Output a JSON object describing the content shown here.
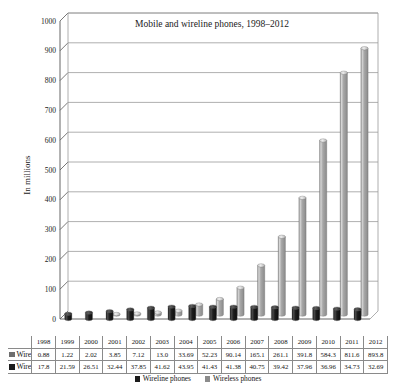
{
  "chart_data": {
    "type": "bar",
    "title": "Mobile and wireline phones, 1998–2012",
    "xlabel": "",
    "ylabel": "In millions",
    "ylim": [
      0,
      1000
    ],
    "ytick_step": 100,
    "yticks": [
      "0",
      "100",
      "200",
      "300",
      "400",
      "500",
      "600",
      "700",
      "800",
      "900",
      "1000"
    ],
    "grid": "horizontal",
    "legend_position": "bottom",
    "style": "3d-cylinder",
    "categories": [
      "1998",
      "1999",
      "2000",
      "2001",
      "2002",
      "2003",
      "2004",
      "2005",
      "2006",
      "2007",
      "2008",
      "2009",
      "2010",
      "2011",
      "2012"
    ],
    "series": [
      {
        "name": "Wireline phones",
        "color": "#1c1c1c",
        "values": [
          17.8,
          21.59,
          26.51,
          32.44,
          37.85,
          41.62,
          43.95,
          41.43,
          41.38,
          40.75,
          39.42,
          37.96,
          36.96,
          34.73,
          32.69
        ],
        "labels": [
          "17.8",
          "21.59",
          "26.51",
          "32.44",
          "37.85",
          "41.62",
          "43.95",
          "41.43",
          "41.38",
          "40.75",
          "39.42",
          "37.96",
          "36.96",
          "34.73",
          "32.69"
        ]
      },
      {
        "name": "Wireless phones",
        "color": "#9e9e9e",
        "values": [
          0.88,
          1.22,
          2.02,
          3.85,
          7.12,
          13.0,
          33.69,
          52.23,
          90.14,
          165.1,
          261.1,
          391.8,
          584.3,
          811.6,
          893.8
        ],
        "labels": [
          "0.88",
          "1.22",
          "2.02",
          "3.85",
          "7.12",
          "13.0",
          "33.69",
          "52.23",
          "90.14",
          "165.1",
          "261.1",
          "391.8",
          "584.3",
          "811.6",
          "893.8"
        ]
      }
    ]
  },
  "table": {
    "corner": "",
    "row_labels": [
      "Wireless phones",
      "Wireline phones"
    ]
  },
  "legend": {
    "items": [
      {
        "label": "Wireline phones",
        "color": "#1c1c1c"
      },
      {
        "label": "Wireless phones",
        "color": "#8c8c8c"
      }
    ]
  },
  "colors": {
    "wireless": "#9e9e9e",
    "wireline": "#1c1c1c",
    "grid": "#9a9a9a",
    "axis": "#555555",
    "background": "#ffffff"
  }
}
